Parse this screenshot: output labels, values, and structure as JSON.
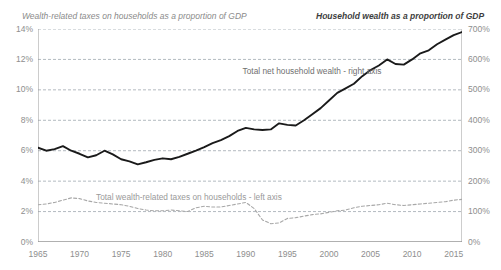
{
  "titles": {
    "left": "Wealth-related taxes on households as a proportion of GDP",
    "right": "Household wealth as a proportion of GDP"
  },
  "annotations": {
    "wealth_series": "Total net household wealth - right axis",
    "tax_series": "Total wealth-related taxes on households - left axis"
  },
  "colors": {
    "wealth_line": "#1a1a1a",
    "tax_line": "#a8a8a8",
    "grid": "#9fa8b0",
    "axis": "#8e8e8e",
    "text": "#8e8e8e"
  },
  "chart_data": {
    "type": "line",
    "xlabel": "",
    "ylabel": "Wealth-related taxes on households as a proportion of GDP",
    "y2label": "Household wealth as a proportion of GDP",
    "xlim": [
      1965,
      2016
    ],
    "ylim": [
      0,
      14
    ],
    "y2lim": [
      0,
      700
    ],
    "grid": true,
    "legend": "annotations-inline",
    "xticks": [
      "1965",
      "1970",
      "1975",
      "1980",
      "1985",
      "1990",
      "1995",
      "2000",
      "2005",
      "2010",
      "2015"
    ],
    "yticks_left": [
      "0%",
      "2%",
      "4%",
      "6%",
      "8%",
      "10%",
      "12%",
      "14%"
    ],
    "yticks_right": [
      "0%",
      "100%",
      "200%",
      "300%",
      "400%",
      "500%",
      "600%",
      "700%"
    ],
    "x": [
      1965,
      1966,
      1967,
      1968,
      1969,
      1970,
      1971,
      1972,
      1973,
      1974,
      1975,
      1976,
      1977,
      1978,
      1979,
      1980,
      1981,
      1982,
      1983,
      1984,
      1985,
      1986,
      1987,
      1988,
      1989,
      1990,
      1991,
      1992,
      1993,
      1994,
      1995,
      1996,
      1997,
      1998,
      1999,
      2000,
      2001,
      2002,
      2003,
      2004,
      2005,
      2006,
      2007,
      2008,
      2009,
      2010,
      2011,
      2012,
      2013,
      2014,
      2015,
      2016
    ],
    "series": [
      {
        "name": "Total net household wealth - right axis",
        "axis": "right",
        "unit": "% of GDP",
        "values": [
          310,
          300,
          305,
          315,
          300,
          290,
          278,
          285,
          300,
          288,
          272,
          265,
          255,
          262,
          270,
          275,
          272,
          280,
          290,
          300,
          312,
          325,
          335,
          348,
          365,
          375,
          370,
          368,
          370,
          390,
          385,
          383,
          400,
          420,
          440,
          465,
          490,
          505,
          520,
          545,
          565,
          580,
          600,
          585,
          583,
          600,
          620,
          630,
          650,
          665,
          680,
          690
        ]
      },
      {
        "name": "Total wealth-related taxes on households - left axis",
        "axis": "left",
        "unit": "% of GDP",
        "values": [
          2.45,
          2.5,
          2.6,
          2.75,
          2.9,
          2.85,
          2.7,
          2.6,
          2.55,
          2.5,
          2.45,
          2.35,
          2.2,
          2.1,
          2.05,
          2.05,
          2.1,
          2.05,
          2.0,
          2.25,
          2.35,
          2.3,
          2.3,
          2.4,
          2.5,
          2.6,
          2.2,
          1.45,
          1.2,
          1.25,
          1.55,
          1.6,
          1.7,
          1.8,
          1.85,
          1.95,
          2.05,
          2.1,
          2.25,
          2.35,
          2.4,
          2.45,
          2.55,
          2.45,
          2.4,
          2.45,
          2.5,
          2.55,
          2.6,
          2.65,
          2.75,
          2.8
        ]
      }
    ]
  }
}
